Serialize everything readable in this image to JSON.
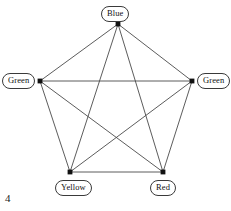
{
  "figure": {
    "number": "4",
    "width": 231,
    "height": 211,
    "background_color": "#ffffff",
    "edge_color": "#4a4a4a",
    "vertex_color": "#111111",
    "label_border_color": "#3a3a3a"
  },
  "chart_data": {
    "type": "diagram",
    "graph_type": "complete-graph-K5",
    "title": "",
    "nodes": [
      {
        "id": "top",
        "label": "Blue",
        "x": 118,
        "y": 24,
        "label_position": "above",
        "label_x": 101,
        "label_y": 6
      },
      {
        "id": "left",
        "label": "Green",
        "x": 40,
        "y": 81,
        "label_position": "left",
        "label_x": 2,
        "label_y": 73
      },
      {
        "id": "right",
        "label": "Green",
        "x": 192,
        "y": 81,
        "label_position": "right",
        "label_x": 197,
        "label_y": 73
      },
      {
        "id": "bottom-left",
        "label": "Yellow",
        "x": 70,
        "y": 172,
        "label_position": "below",
        "label_x": 55,
        "label_y": 180
      },
      {
        "id": "bottom-right",
        "label": "Red",
        "x": 163,
        "y": 172,
        "label_position": "below",
        "label_x": 150,
        "label_y": 180
      }
    ],
    "edges": [
      {
        "from": "top",
        "to": "left"
      },
      {
        "from": "top",
        "to": "right"
      },
      {
        "from": "top",
        "to": "bottom-left"
      },
      {
        "from": "top",
        "to": "bottom-right"
      },
      {
        "from": "left",
        "to": "right"
      },
      {
        "from": "left",
        "to": "bottom-left"
      },
      {
        "from": "left",
        "to": "bottom-right"
      },
      {
        "from": "right",
        "to": "bottom-left"
      },
      {
        "from": "right",
        "to": "bottom-right"
      },
      {
        "from": "bottom-left",
        "to": "bottom-right"
      }
    ],
    "edge_count": 10,
    "node_count": 5
  }
}
